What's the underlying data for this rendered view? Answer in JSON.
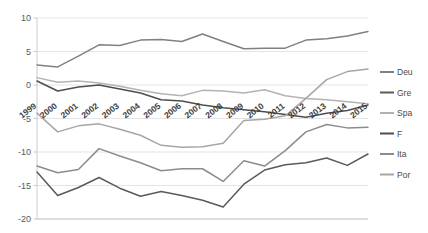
{
  "chart_data": {
    "type": "line",
    "title": "",
    "xlabel": "",
    "ylabel": "",
    "ylim": [
      -20,
      10
    ],
    "yticks": [
      10,
      5,
      0,
      -5,
      -10,
      -15,
      -20
    ],
    "grid": true,
    "legend_position": "right",
    "categories": [
      "1999",
      "2000",
      "2001",
      "2002",
      "2003",
      "2004",
      "2005",
      "2006",
      "2007",
      "2008",
      "2009",
      "2010",
      "2011",
      "2012",
      "2013",
      "2014",
      "2015"
    ],
    "series": [
      {
        "name": "Deu",
        "color": "#808080",
        "values": [
          3.0,
          2.7,
          4.3,
          6.0,
          5.9,
          6.7,
          6.8,
          6.5,
          7.6,
          6.5,
          5.4,
          5.5,
          5.5,
          6.7,
          6.9,
          7.3,
          8.0
        ]
      },
      {
        "name": "Gre",
        "color": "#5a5a5a",
        "values": [
          -13.0,
          -16.5,
          -15.3,
          -13.8,
          -15.4,
          -16.6,
          -15.9,
          -16.5,
          -17.2,
          -18.2,
          -14.8,
          -12.7,
          -11.9,
          -11.6,
          -10.9,
          -12.0,
          -10.3
        ]
      },
      {
        "name": "Spa",
        "color": "#b3b3b3",
        "values": [
          1.1,
          0.4,
          0.6,
          0.3,
          -0.2,
          -0.8,
          -1.3,
          -1.6,
          -0.8,
          -0.9,
          -1.2,
          -0.7,
          -1.6,
          -2.0,
          -2.2,
          -2.5,
          -2.8
        ]
      },
      {
        "name": "F",
        "color": "#4d4d4d",
        "values": [
          0.6,
          -0.9,
          -0.3,
          0.0,
          -0.6,
          -1.2,
          -2.2,
          -2.4,
          -3.0,
          -3.4,
          -3.7,
          -4.0,
          -4.4,
          -4.8,
          -4.2,
          -3.8,
          -3.0
        ]
      },
      {
        "name": "Ita",
        "color": "#8c8c8c",
        "values": [
          -12.1,
          -13.1,
          -12.6,
          -9.5,
          -10.6,
          -11.6,
          -12.8,
          -12.5,
          -12.5,
          -14.4,
          -11.3,
          -12.1,
          -9.8,
          -7.0,
          -5.9,
          -6.4,
          -6.3
        ]
      },
      {
        "name": "Por",
        "color": "#a6a6a6",
        "values": [
          -4.2,
          -7.0,
          -6.1,
          -5.8,
          -6.6,
          -7.5,
          -9.0,
          -9.3,
          -9.2,
          -8.7,
          -5.3,
          -5.1,
          -4.6,
          -2.0,
          0.8,
          2.0,
          2.4
        ]
      }
    ]
  },
  "legend": {
    "items": [
      {
        "label": "Deu"
      },
      {
        "label": "Gre"
      },
      {
        "label": "Spa"
      },
      {
        "label": "F"
      },
      {
        "label": "Ita"
      },
      {
        "label": "Por"
      }
    ]
  }
}
